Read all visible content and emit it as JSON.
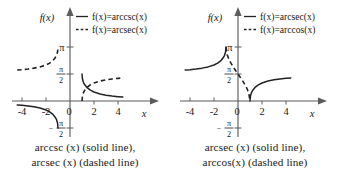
{
  "figure": {
    "background": "#ffffff",
    "ink_color": "#232323",
    "axis_color": "#5b5b5b"
  },
  "panels": [
    {
      "id": "left",
      "axis_labels": {
        "y": "f(x)",
        "x": "x"
      },
      "legend": [
        {
          "style": "solid",
          "label": "f(x)=arccsc(x)"
        },
        {
          "style": "dashed",
          "label": "f(x)=arcsec(x)"
        }
      ],
      "caption_line1": "arccsc (x) (solid line),",
      "caption_line2": "arcsec (x) (dashed line)",
      "chart_data": {
        "type": "line",
        "title": "arccsc (x) (solid line), arcsec (x) (dashed line)",
        "xlabel": "x",
        "ylabel": "f(x)",
        "xlim": [
          -4.6,
          4.6
        ],
        "ylim": [
          -2.2,
          3.6
        ],
        "grid": false,
        "legend_position": "top-right",
        "xticks": [
          -4,
          -2,
          0,
          2,
          4
        ],
        "xticklabels": [
          "-4",
          "-2",
          "0",
          "2",
          "4"
        ],
        "yticks": [
          3.1416,
          1.5708,
          -1.5708
        ],
        "yticklabels": [
          "π",
          "π/2",
          "-π/2"
        ],
        "series": [
          {
            "name": "f(x)=arccsc(x)",
            "style": "solid",
            "branches": [
              {
                "x": [
                  -4.4,
                  -4,
                  -3.5,
                  -3,
                  -2.5,
                  -2,
                  -1.7,
                  -1.45,
                  -1.25,
                  -1.12,
                  -1.04,
                  -1.0
                ],
                "y": [
                  -0.2292,
                  -0.2527,
                  -0.2898,
                  -0.3398,
                  -0.4115,
                  -0.5236,
                  -0.6288,
                  -0.7592,
                  -0.9273,
                  -1.0853,
                  -1.2752,
                  -1.5708
                ]
              },
              {
                "x": [
                  1.0,
                  1.04,
                  1.12,
                  1.25,
                  1.45,
                  1.7,
                  2,
                  2.5,
                  3,
                  3.5,
                  4,
                  4.4
                ],
                "y": [
                  1.5708,
                  1.2752,
                  1.0853,
                  0.9273,
                  0.7592,
                  0.6288,
                  0.5236,
                  0.4115,
                  0.3398,
                  0.2898,
                  0.2527,
                  0.2292
                ]
              }
            ]
          },
          {
            "name": "f(x)=arcsec(x)",
            "style": "dashed",
            "branches": [
              {
                "x": [
                  -4.4,
                  -4,
                  -3.5,
                  -3,
                  -2.5,
                  -2,
                  -1.7,
                  -1.45,
                  -1.25,
                  -1.12,
                  -1.04,
                  -1.0
                ],
                "y": [
                  1.8,
                  1.8235,
                  1.8606,
                  1.9106,
                  1.9823,
                  2.0944,
                  2.1996,
                  2.33,
                  2.4981,
                  2.6561,
                  2.846,
                  3.1416
                ]
              },
              {
                "x": [
                  1.0,
                  1.04,
                  1.12,
                  1.25,
                  1.45,
                  1.7,
                  2,
                  2.5,
                  3,
                  3.5,
                  4,
                  4.4
                ],
                "y": [
                  0.0,
                  0.2956,
                  0.4855,
                  0.6435,
                  0.8116,
                  0.942,
                  1.0472,
                  1.1593,
                  1.231,
                  1.2809,
                  1.3181,
                  1.3416
                ]
              }
            ]
          }
        ]
      }
    },
    {
      "id": "right",
      "axis_labels": {
        "y": "f(x)",
        "x": "x"
      },
      "legend": [
        {
          "style": "solid",
          "label": "f(x)=arcsec(x)"
        },
        {
          "style": "dashed",
          "label": "f(x)=arccos(x)"
        }
      ],
      "caption_line1": "arcsec (x) (solid line),",
      "caption_line2": "arccos(x) (dashed line)",
      "chart_data": {
        "type": "line",
        "title": "arcsec (x) (solid line), arccos(x) (dashed line)",
        "xlabel": "x",
        "ylabel": "f(x)",
        "xlim": [
          -4.6,
          4.6
        ],
        "ylim": [
          -2.2,
          3.6
        ],
        "grid": false,
        "legend_position": "top-right",
        "xticks": [
          -4,
          -2,
          0,
          2,
          4
        ],
        "xticklabels": [
          "-4",
          "-2",
          "0",
          "2",
          "4"
        ],
        "yticks": [
          3.1416,
          1.5708,
          -1.5708
        ],
        "yticklabels": [
          "π",
          "π/2",
          "-π/2"
        ],
        "series": [
          {
            "name": "f(x)=arcsec(x)",
            "style": "solid",
            "branches": [
              {
                "x": [
                  -4.4,
                  -4,
                  -3.5,
                  -3,
                  -2.5,
                  -2,
                  -1.7,
                  -1.45,
                  -1.25,
                  -1.12,
                  -1.04,
                  -1.0
                ],
                "y": [
                  1.8,
                  1.8235,
                  1.8606,
                  1.9106,
                  1.9823,
                  2.0944,
                  2.1996,
                  2.33,
                  2.4981,
                  2.6561,
                  2.846,
                  3.1416
                ]
              },
              {
                "x": [
                  1.0,
                  1.04,
                  1.12,
                  1.25,
                  1.45,
                  1.7,
                  2,
                  2.5,
                  3,
                  3.5,
                  4,
                  4.4
                ],
                "y": [
                  0.0,
                  0.2956,
                  0.4855,
                  0.6435,
                  0.8116,
                  0.942,
                  1.0472,
                  1.1593,
                  1.231,
                  1.2809,
                  1.3181,
                  1.3416
                ]
              }
            ]
          },
          {
            "name": "f(x)=arccos(x)",
            "style": "dashed",
            "branches": [
              {
                "x": [
                  -1.0,
                  -0.9,
                  -0.75,
                  -0.6,
                  -0.4,
                  -0.2,
                  0,
                  0.2,
                  0.4,
                  0.6,
                  0.75,
                  0.9,
                  1.0
                ],
                "y": [
                  3.1416,
                  2.6906,
                  2.4189,
                  2.2143,
                  1.9823,
                  1.7722,
                  1.5708,
                  1.3694,
                  1.1593,
                  0.9273,
                  0.7227,
                  0.451,
                  0.0
                ]
              }
            ]
          }
        ]
      }
    }
  ]
}
